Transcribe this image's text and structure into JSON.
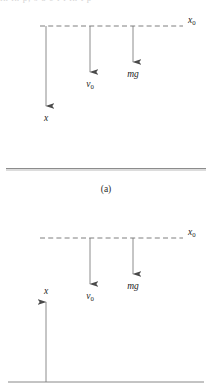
{
  "document": {
    "text_remnant": "in in  p;  s  o   e   i   i  in  t  p",
    "figure_type": "physics-free-body-diagram",
    "caption_a": "(a)"
  },
  "panel_a": {
    "name": "x-axis-downward-convention",
    "reference_line_label": "x_0",
    "reference_line_label_base": "x",
    "reference_line_label_sub": "0",
    "arrows": [
      {
        "id": "position-axis",
        "label_base": "x",
        "label_sub": "",
        "direction": "down",
        "x": 46,
        "y_start": 26,
        "y_end": 106,
        "label_x": 46,
        "label_y": 121
      },
      {
        "id": "initial-velocity",
        "label_base": "v",
        "label_sub": "0",
        "direction": "down",
        "x": 90,
        "y_start": 26,
        "y_end": 72,
        "label_x": 90,
        "label_y": 87
      },
      {
        "id": "gravity-force",
        "label_base": "mg",
        "label_sub": "",
        "direction": "down",
        "x": 133,
        "y_start": 26,
        "y_end": 62,
        "label_x": 133,
        "label_y": 77
      }
    ],
    "dashed_line": {
      "x1": 40,
      "x2": 183,
      "y": 26
    },
    "label_x0_pos": {
      "x": 188,
      "y": 23
    }
  },
  "panel_b": {
    "name": "x-axis-upward-convention",
    "reference_line_label": "x_0",
    "reference_line_label_base": "x",
    "reference_line_label_sub": "0",
    "arrows": [
      {
        "id": "position-axis",
        "label_base": "x",
        "label_sub": "",
        "direction": "up",
        "x": 46,
        "y_start": 176,
        "y_end": 96,
        "label_x": 46,
        "label_y": 88
      },
      {
        "id": "initial-velocity",
        "label_base": "v",
        "label_sub": "0",
        "direction": "down",
        "x": 90,
        "y_start": 32,
        "y_end": 78,
        "label_x": 90,
        "label_y": 93
      },
      {
        "id": "gravity-force",
        "label_base": "mg",
        "label_sub": "",
        "direction": "down",
        "x": 133,
        "y_start": 32,
        "y_end": 68,
        "label_x": 133,
        "label_y": 83
      }
    ],
    "dashed_line": {
      "x1": 40,
      "x2": 183,
      "y": 32
    },
    "ground_line": {
      "x1": 8,
      "x2": 204,
      "y": 176
    },
    "label_x0_pos": {
      "x": 188,
      "y": 29
    }
  },
  "colors": {
    "line": "#6f6f6f",
    "arrow_head": "#4a4a4a",
    "text": "#1c1c1c",
    "separator_dark": "#8c8c8c",
    "separator_light": "#dcdcdc",
    "background": "#ffffff"
  }
}
